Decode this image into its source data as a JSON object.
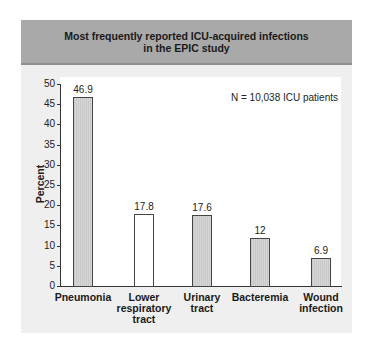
{
  "header": {
    "title_line1": "Most frequently reported ICU-acquired infections",
    "title_line2": "in the EPIC study"
  },
  "annotation": "N = 10,038 ICU patients",
  "chart_data": {
    "type": "bar",
    "title": "Most frequently reported ICU-acquired infections in the EPIC study",
    "categories": [
      "Pneumonia",
      "Lower respiratory tract",
      "Urinary tract",
      "Bacteremia",
      "Wound infection"
    ],
    "category_lines": [
      [
        "Pneumonia"
      ],
      [
        "Lower",
        "respiratory",
        "tract"
      ],
      [
        "Urinary",
        "tract"
      ],
      [
        "Bacteremia"
      ],
      [
        "Wound",
        "infection"
      ]
    ],
    "values": [
      46.9,
      17.8,
      17.6,
      12,
      6.9
    ],
    "value_labels": [
      "46.9",
      "17.8",
      "17.6",
      "12",
      "6.9"
    ],
    "bar_styles": [
      "shaded",
      "hollow",
      "shaded",
      "shaded",
      "shaded"
    ],
    "xlabel": "",
    "ylabel": "Percent",
    "ylim": [
      0,
      50
    ],
    "yticks": [
      0,
      5,
      10,
      15,
      20,
      25,
      30,
      35,
      40,
      45,
      50
    ],
    "grid": false,
    "legend": null,
    "annotations": [
      "N = 10,038 ICU patients"
    ]
  },
  "colors": {
    "header_bg": "#a9a9a9",
    "panel_bg": "#efefef",
    "bar_fill": "#d0d0d0",
    "bar_hollow": "#ffffff",
    "bar_border": "#444444"
  }
}
